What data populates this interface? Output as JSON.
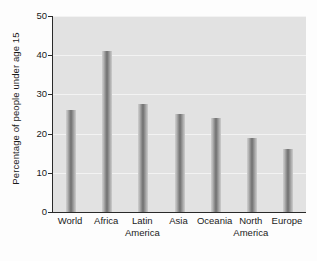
{
  "chart_data": {
    "type": "bar",
    "title": "",
    "xlabel": "",
    "ylabel": "Percentage of people under age 15",
    "categories": [
      "World",
      "Africa",
      "Latin America",
      "Asia",
      "Oceania",
      "North America",
      "Europe"
    ],
    "category_lines": [
      [
        "World"
      ],
      [
        "Africa"
      ],
      [
        "Latin",
        "America"
      ],
      [
        "Asia"
      ],
      [
        "Oceania"
      ],
      [
        "North",
        "America"
      ],
      [
        "Europe"
      ]
    ],
    "values": [
      26,
      41,
      27.5,
      25,
      24,
      19,
      16
    ],
    "ylim": [
      0,
      50
    ],
    "yticks": [
      0,
      10,
      20,
      30,
      40,
      50
    ],
    "ytick_labels": [
      "0",
      "10",
      "20",
      "30",
      "40",
      "50"
    ],
    "grid": true,
    "legend": "none",
    "bar_color": "#8e8e8e",
    "plot_background": "#e2e2e2",
    "axis_color": "#2a2a2a",
    "gridline_color": "#f3f3f3"
  }
}
